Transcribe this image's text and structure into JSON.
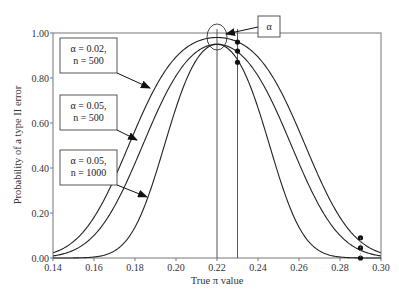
{
  "chart_data": {
    "type": "line",
    "title": "",
    "xlabel": "True π value",
    "ylabel": "Probability of a type II error",
    "xlim": [
      0.14,
      0.3
    ],
    "ylim": [
      0.0,
      1.0
    ],
    "xticks": [
      "0.14",
      "0.16",
      "0.18",
      "0.20",
      "0.22",
      "0.24",
      "0.26",
      "0.28",
      "0.30"
    ],
    "yticks": [
      "0.00",
      "0.20",
      "0.40",
      "0.60",
      "0.80",
      "1.00"
    ],
    "grid": false,
    "hypothesized_pi": 0.22,
    "reference_lines_x": [
      0.22,
      0.23
    ],
    "series": [
      {
        "name": "α = 0.02, n = 500",
        "label_lines": [
          "α = 0.02,",
          "n = 500"
        ],
        "alpha": 0.02,
        "n": 500,
        "x": [
          0.14,
          0.15,
          0.16,
          0.17,
          0.18,
          0.19,
          0.2,
          0.21,
          0.22,
          0.23,
          0.24,
          0.25,
          0.26,
          0.27,
          0.28,
          0.29,
          0.3
        ],
        "values": [
          0.01,
          0.04,
          0.12,
          0.28,
          0.5,
          0.72,
          0.88,
          0.96,
          0.98,
          0.96,
          0.88,
          0.72,
          0.5,
          0.3,
          0.15,
          0.09,
          0.03
        ]
      },
      {
        "name": "α = 0.05, n = 500",
        "label_lines": [
          "α = 0.05,",
          "n = 500"
        ],
        "alpha": 0.05,
        "n": 500,
        "x": [
          0.14,
          0.15,
          0.16,
          0.17,
          0.18,
          0.19,
          0.2,
          0.21,
          0.22,
          0.23,
          0.24,
          0.25,
          0.26,
          0.27,
          0.28,
          0.29,
          0.3
        ],
        "values": [
          0.0,
          0.02,
          0.07,
          0.19,
          0.39,
          0.63,
          0.82,
          0.93,
          0.95,
          0.92,
          0.81,
          0.63,
          0.42,
          0.23,
          0.11,
          0.045,
          0.02
        ]
      },
      {
        "name": "α = 0.05, n = 1000",
        "label_lines": [
          "α = 0.05,",
          "n = 1000"
        ],
        "alpha": 0.05,
        "n": 1000,
        "x": [
          0.14,
          0.15,
          0.16,
          0.17,
          0.18,
          0.19,
          0.2,
          0.21,
          0.22,
          0.23,
          0.24,
          0.25,
          0.26,
          0.27,
          0.28,
          0.29,
          0.3
        ],
        "values": [
          0.0,
          0.0,
          0.0,
          0.03,
          0.14,
          0.4,
          0.71,
          0.91,
          0.95,
          0.87,
          0.61,
          0.31,
          0.11,
          0.03,
          0.01,
          0.0,
          0.0
        ]
      }
    ],
    "highlighted_points": [
      {
        "x": 0.23,
        "values": [
          0.96,
          0.92,
          0.87
        ]
      },
      {
        "x": 0.29,
        "values": [
          0.09,
          0.045,
          0.0
        ]
      }
    ],
    "annotations": [
      {
        "text": "α",
        "points_to": "peak at π = 0.22 (circled)"
      }
    ]
  }
}
